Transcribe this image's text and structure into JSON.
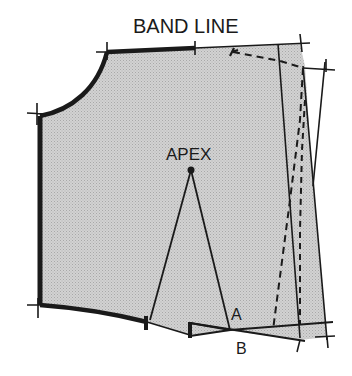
{
  "diagram": {
    "title": "BAND LINE",
    "labels": {
      "apex": "APEX",
      "point_a": "A",
      "point_b": "B"
    },
    "colors": {
      "fill": "#c9c9c9",
      "line": "#1a1a1a",
      "background": "#ffffff"
    }
  }
}
